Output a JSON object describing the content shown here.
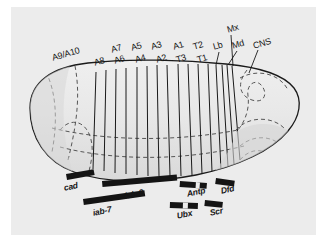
{
  "figure": {
    "panel_background": "#ececec",
    "embryo_fill": "#e4e4e4",
    "outline_color": "#1a1a1a",
    "bar_color": "#141414"
  },
  "segment_labels_upper": [
    {
      "text": "A9/A10",
      "x": 51,
      "y": 54
    },
    {
      "text": "A7",
      "x": 110,
      "y": 46
    },
    {
      "text": "A5",
      "x": 130,
      "y": 44
    },
    {
      "text": "A3",
      "x": 150,
      "y": 43
    },
    {
      "text": "A1",
      "x": 172,
      "y": 43
    },
    {
      "text": "T2",
      "x": 192,
      "y": 43
    },
    {
      "text": "Lb",
      "x": 215,
      "y": 43
    },
    {
      "text": "Md",
      "x": 233,
      "y": 42
    },
    {
      "text": "Mx",
      "x": 227,
      "y": 26
    },
    {
      "text": "CNS",
      "x": 253,
      "y": 41
    }
  ],
  "segment_labels_lower": [
    {
      "text": "A8",
      "x": 95,
      "y": 59
    },
    {
      "text": "A6",
      "x": 115,
      "y": 57
    },
    {
      "text": "A4",
      "x": 136,
      "y": 56
    },
    {
      "text": "A2",
      "x": 157,
      "y": 56
    },
    {
      "text": "T3",
      "x": 177,
      "y": 56
    },
    {
      "text": "T1",
      "x": 198,
      "y": 56
    }
  ],
  "gene_labels": [
    {
      "text": "cad",
      "x": 63,
      "y": 188
    },
    {
      "text": "iab-2",
      "x": 125,
      "y": 196
    },
    {
      "text": "iab-7",
      "x": 93,
      "y": 213
    },
    {
      "text": "Antp",
      "x": 188,
      "y": 194
    },
    {
      "text": "Ubx",
      "x": 178,
      "y": 216
    },
    {
      "text": "Dfd",
      "x": 222,
      "y": 191
    },
    {
      "text": "Scr",
      "x": 211,
      "y": 213
    }
  ],
  "gene_bars": [
    {
      "name": "cad",
      "x": 66,
      "y": 174,
      "w": 28,
      "h": 6,
      "rot": -10,
      "gaps": []
    },
    {
      "name": "iab-2",
      "x": 102,
      "y": 181,
      "w": 75,
      "h": 6,
      "rot": -5,
      "gaps": []
    },
    {
      "name": "iab-7",
      "x": 83,
      "y": 199,
      "w": 62,
      "h": 6,
      "rot": -8,
      "gaps": []
    },
    {
      "name": "Antp",
      "x": 180,
      "y": 181,
      "w": 27,
      "h": 6,
      "rot": 4,
      "gaps": [
        {
          "x": 16,
          "w": 4
        }
      ]
    },
    {
      "name": "Ubx",
      "x": 170,
      "y": 202,
      "w": 28,
      "h": 6,
      "rot": 2,
      "gaps": [
        {
          "x": 13,
          "w": 5
        }
      ]
    },
    {
      "name": "Dfd",
      "x": 216,
      "y": 178,
      "w": 19,
      "h": 6,
      "rot": 8,
      "gaps": []
    },
    {
      "name": "Scr",
      "x": 205,
      "y": 200,
      "w": 18,
      "h": 6,
      "rot": 6,
      "gaps": []
    }
  ],
  "segment_lines_count": 16,
  "colors": {
    "panel": "#ececec",
    "embryo_light": "#e9e9e9",
    "embryo_shade": "#dcdcdc",
    "ink": "#1a1a1a",
    "bar": "#141414"
  }
}
